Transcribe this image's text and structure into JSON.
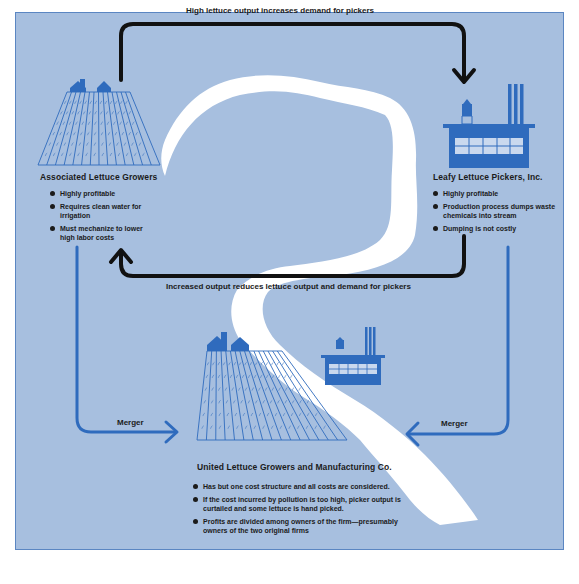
{
  "colors": {
    "background": "#a7bfdf",
    "river": "#ffffff",
    "icon_blue": "#2f6bbd",
    "black_arrow": "#111111",
    "merger_arrow": "#2f6bbd"
  },
  "top_arrow": {
    "label": "High lettuce output increases demand for pickers"
  },
  "bottom_arrow": {
    "label": "Increased output reduces lettuce output and demand for pickers"
  },
  "growers": {
    "icon": "farm-field-icon",
    "title": "Associated Lettuce Growers",
    "bullets": [
      "Highly profitable",
      "Requires clean water for irrigation",
      "Must mechanize to lower high labor costs"
    ]
  },
  "pickers": {
    "icon": "factory-icon",
    "title": "Leafy Lettuce Pickers, Inc.",
    "bullets": [
      "Highly profitable",
      "Production process dumps waste chemicals into stream",
      "Dumping is not costly"
    ]
  },
  "merger_left": {
    "label": "Merger"
  },
  "merger_right": {
    "label": "Merger"
  },
  "united": {
    "icons": [
      "farm-field-icon",
      "factory-icon"
    ],
    "title": "United Lettuce Growers and Manufacturing Co.",
    "bullets": [
      "Has but one cost structure and all costs are considered.",
      "If the cost incurred by pollution is too high, picker output is curtailed and some lettuce is hand picked.",
      "Profits are divided among owners of the firm—presumably owners of the two original firms"
    ]
  }
}
